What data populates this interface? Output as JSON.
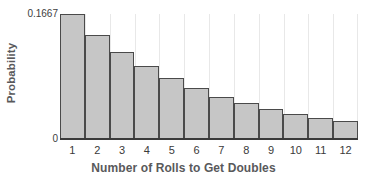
{
  "chart_data": {
    "type": "bar",
    "title": "",
    "xlabel": "Number of Rolls to Get Doubles",
    "ylabel": "Probability",
    "categories": [
      "1",
      "2",
      "3",
      "4",
      "5",
      "6",
      "7",
      "8",
      "9",
      "10",
      "11",
      "12"
    ],
    "values": [
      0.1667,
      0.1389,
      0.1157,
      0.0965,
      0.0804,
      0.067,
      0.0558,
      0.0465,
      0.0388,
      0.0323,
      0.0269,
      0.0224
    ],
    "ylim": [
      0,
      0.1667
    ],
    "ytick_labels": [
      "0.1667",
      "0"
    ],
    "ytick_values": [
      0.1667,
      0
    ],
    "xtick_labels": [
      "1",
      "2",
      "3",
      "4",
      "5",
      "6",
      "7",
      "8",
      "9",
      "10",
      "11",
      "12"
    ],
    "grid": "vertical-only",
    "legend": "none",
    "bar_fill_color": "#c6c6c6",
    "bar_edge_color": "#4a4a4a",
    "axis_color": "#3a3a3a",
    "gridline_color": "#e8e8e8",
    "label_color": "#59595b"
  }
}
